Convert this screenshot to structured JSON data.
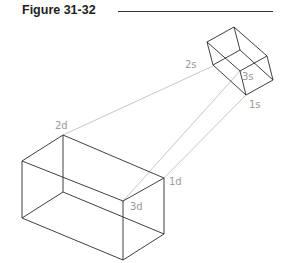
{
  "figure": {
    "title": "Figure 31-32"
  },
  "labels": {
    "l2s": "2s",
    "l3s": "3s",
    "l1s": "1s",
    "l2d": "2d",
    "l1d": "1d",
    "l3d": "3d"
  },
  "colors": {
    "edge": "#2a2a2a",
    "projection": "#b5b5b5",
    "label": "#9a9a9a"
  }
}
